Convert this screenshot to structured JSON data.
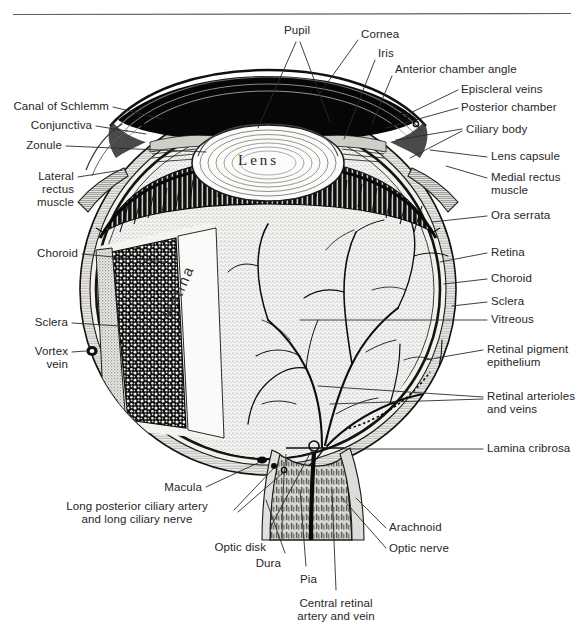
{
  "figure": {
    "style": "pen-and-ink stipple engraving, black on white",
    "rule_line": "horizontal rule across top of figure"
  },
  "inline_text": {
    "lens": "Lens",
    "retina": "Retina"
  },
  "labels": {
    "pupil": "Pupil",
    "cornea": "Cornea",
    "iris": "Iris",
    "anterior_chamber_angle": "Anterior chamber angle",
    "episcleral_veins": "Episcleral veins",
    "posterior_chamber": "Posterior chamber",
    "ciliary_body": "Ciliary body",
    "lens_capsule": "Lens capsule",
    "medial_rectus_muscle": "Medial rectus\nmuscle",
    "ora_serrata": "Ora serrata",
    "retina_right": "Retina",
    "choroid_right": "Choroid",
    "sclera_right": "Sclera",
    "vitreous": "Vitreous",
    "retinal_pigment_epithelium": "Retinal pigment\nepithelium",
    "retinal_arterioles_and_veins": "Retinal arterioles\nand veins",
    "lamina_cribrosa": "Lamina cribrosa",
    "canal_of_schlemm": "Canal of Schlemm",
    "conjunctiva": "Conjunctiva",
    "zonule": "Zonule",
    "lateral_rectus_muscle": "Lateral\nrectus\nmuscle",
    "choroid_left": "Choroid",
    "sclera_left": "Sclera",
    "vortex_vein": "Vortex\nvein",
    "macula": "Macula",
    "long_posterior_ciliary": "Long posterior ciliary artery\nand long ciliary nerve",
    "optic_disk": "Optic disk",
    "dura": "Dura",
    "pia": "Pia",
    "central_retinal_artery_and_vein": "Central retinal\nartery and vein",
    "arachnoid": "Arachnoid",
    "optic_nerve": "Optic nerve"
  },
  "colors": {
    "ink": "#1b1b1b",
    "text": "#262626",
    "leader": "#2a2a2a",
    "paper": "#ffffff",
    "sclera_fill": "#f2f1ef",
    "vitreous_fill": "#e9e8e4",
    "choroid_dark": "#151515",
    "iris_black": "#070707",
    "lens_fill": "#fbfbfa"
  }
}
